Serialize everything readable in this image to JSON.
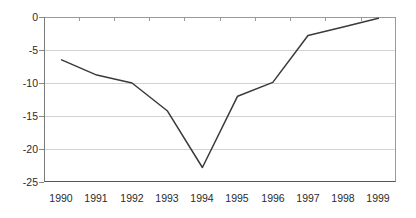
{
  "chart_data": {
    "type": "line",
    "title": "",
    "subtitle": "",
    "xlabel": "",
    "ylabel": "",
    "categories": [
      "1990",
      "1991",
      "1992",
      "1993",
      "1994",
      "1995",
      "1996",
      "1997",
      "1998",
      "1999"
    ],
    "values": [
      -6.5,
      -8.8,
      -10.0,
      -14.2,
      -22.8,
      -12.0,
      -9.9,
      -2.8,
      -1.5,
      -0.2
    ],
    "series": [
      {
        "name": "",
        "values": [
          -6.5,
          -8.8,
          -10.0,
          -14.2,
          -22.8,
          -12.0,
          -9.9,
          -2.8,
          -1.5,
          -0.2
        ]
      }
    ],
    "ylim": [
      -25,
      0
    ],
    "yticks": [
      0,
      -5,
      -10,
      -15,
      -20,
      -25
    ],
    "ytick_labels": [
      "0",
      "-5",
      "-10",
      "-15",
      "-20",
      "-25"
    ],
    "grid": true,
    "grid_axis": "y",
    "legend": false,
    "legend_position": "none",
    "annotations": [],
    "colors": {
      "line": "#3a3a3a",
      "gridline": "#d2d2d2",
      "axis": "#555555",
      "text": "#2b2b2b",
      "background": "#ffffff"
    }
  }
}
